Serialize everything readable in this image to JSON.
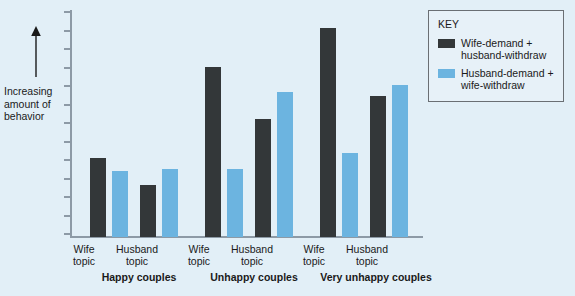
{
  "axis": {
    "y_caption": "Increasing amount of behavior",
    "arrow_icon": "up-arrow-icon",
    "tick_count": 13
  },
  "legend": {
    "title": "KEY",
    "entries": [
      {
        "label": "Wife-demand + husband-withdraw",
        "color": "#333739",
        "swatch_name": "legend-swatch-wife-demand"
      },
      {
        "label": "Husband-demand + wife-withdraw",
        "color": "#6cb4e0",
        "swatch_name": "legend-swatch-husband-demand"
      }
    ]
  },
  "topic_labels": [
    "Wife topic",
    "Husband topic",
    "Wife topic",
    "Husband topic",
    "Wife topic",
    "Husband topic"
  ],
  "group_labels": [
    "Happy couples",
    "Unhappy couples",
    "Very unhappy couples"
  ],
  "chart_data": {
    "type": "bar",
    "title": "",
    "xlabel": "",
    "ylabel": "Increasing amount of behavior",
    "grid": false,
    "legend_position": "top-right",
    "ylim": [
      0,
      100
    ],
    "y_axis_ticks_labeled": false,
    "groups": [
      "Happy couples",
      "Unhappy couples",
      "Very unhappy couples"
    ],
    "categories": [
      "Happy couples / Wife topic",
      "Happy couples / Husband topic",
      "Unhappy couples / Wife topic",
      "Unhappy couples / Husband topic",
      "Very unhappy couples / Wife topic",
      "Very unhappy couples / Husband topic"
    ],
    "series": [
      {
        "name": "Wife-demand + husband-withdraw",
        "color": "#333739",
        "values": [
          35,
          23,
          75,
          52,
          92,
          62
        ]
      },
      {
        "name": "Husband-demand + wife-withdraw",
        "color": "#6cb4e0",
        "values": [
          29,
          30,
          30,
          64,
          37,
          67
        ]
      }
    ]
  },
  "layout": {
    "bar_width": 16,
    "bar_x_positions": [
      18,
      40,
      68,
      90,
      133,
      155,
      183,
      205,
      248,
      270,
      298,
      320
    ],
    "topic_label_x": [
      84,
      137,
      199,
      252,
      314,
      367
    ],
    "group_label_x": [
      81,
      196,
      311
    ],
    "group_label_width": [
      116,
      116,
      130
    ]
  }
}
